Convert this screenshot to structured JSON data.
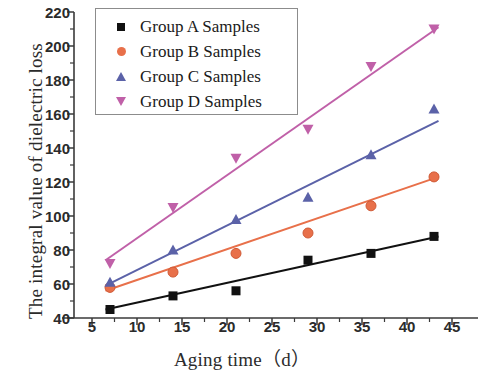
{
  "chart_data": {
    "type": "scatter",
    "title": "",
    "xlabel": "Aging time（d）",
    "ylabel": "The integral value of dielectric loss",
    "xlim": [
      3,
      47
    ],
    "ylim": [
      40,
      220
    ],
    "x_ticks": [
      5,
      10,
      15,
      20,
      25,
      30,
      35,
      40,
      45
    ],
    "y_ticks": [
      40,
      60,
      80,
      100,
      120,
      140,
      160,
      180,
      200,
      220
    ],
    "x_minor_step": 2.5,
    "y_minor_step": 10,
    "grid": false,
    "legend_position": "upper-left",
    "x": [
      7,
      14,
      21,
      29,
      36,
      43
    ],
    "series": [
      {
        "name": "Group A Samples",
        "marker": "square",
        "color": "#111111",
        "line_color": "#111111",
        "values": [
          45,
          53,
          56,
          74,
          78,
          88
        ],
        "fit_endpoints": [
          [
            6.5,
            45
          ],
          [
            43.5,
            88
          ]
        ]
      },
      {
        "name": "Group B Samples",
        "marker": "circle",
        "color": "#e8704a",
        "line_color": "#e8704a",
        "values": [
          58,
          67,
          78,
          90,
          106,
          123
        ],
        "fit_endpoints": [
          [
            6.5,
            56
          ],
          [
            43.5,
            123
          ]
        ]
      },
      {
        "name": "Group C Samples",
        "marker": "triangle-up",
        "color": "#5b62a8",
        "line_color": "#5b62a8",
        "values": [
          61,
          80,
          98,
          111,
          136,
          163
        ],
        "fit_endpoints": [
          [
            6.5,
            59
          ],
          [
            43.5,
            156
          ]
        ]
      },
      {
        "name": "Group D Samples",
        "marker": "triangle-down",
        "color": "#c060a8",
        "line_color": "#c060a8",
        "values": [
          72,
          105,
          134,
          151,
          188,
          210
        ],
        "fit_endpoints": [
          [
            6.5,
            74
          ],
          [
            43.5,
            211
          ]
        ]
      }
    ]
  },
  "axes": {
    "x_title": "Aging time（d）",
    "y_title": "The integral value of dielectric loss",
    "x_tick_labels": [
      "5",
      "10",
      "15",
      "20",
      "25",
      "30",
      "35",
      "40",
      "45"
    ],
    "y_tick_labels": [
      "40",
      "60",
      "80",
      "100",
      "120",
      "140",
      "160",
      "180",
      "200",
      "220"
    ]
  },
  "legend": {
    "items": [
      {
        "label": "Group A Samples",
        "marker": "square-marker",
        "color": "#111111"
      },
      {
        "label": "Group B Samples",
        "marker": "circle-marker",
        "color": "#e8704a"
      },
      {
        "label": "Group C Samples",
        "marker": "triangle-up-marker",
        "color": "#5b62a8"
      },
      {
        "label": "Group D Samples",
        "marker": "triangle-down-marker",
        "color": "#c060a8"
      }
    ]
  },
  "colors": {
    "axis": "#3a3a3a",
    "text": "#2b2b2b",
    "background": "#ffffff"
  }
}
